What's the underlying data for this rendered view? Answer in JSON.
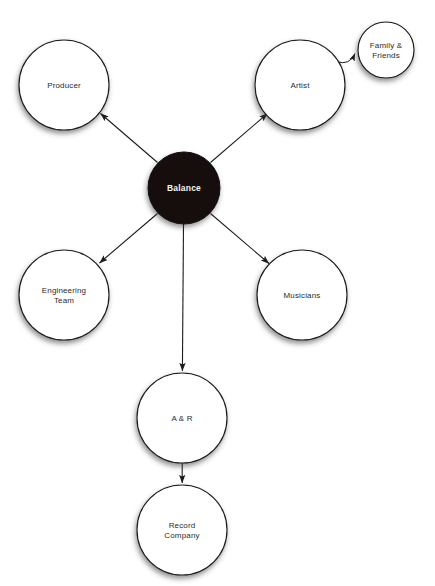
{
  "diagram": {
    "background_color": "#ffffff",
    "nodes": [
      {
        "id": "balance",
        "label": "Balance",
        "lines": [
          "Balance"
        ],
        "cx": 184,
        "cy": 188,
        "r": 36,
        "fill": "#120f0e",
        "text_color": "#f4f4f4",
        "style": "filled-dark"
      },
      {
        "id": "producer",
        "label": "Producer",
        "lines": [
          "Producer"
        ],
        "cx": 64,
        "cy": 85,
        "r": 45,
        "fill": "#ffffff",
        "text_color": "#2b2b2b",
        "style": "outlined"
      },
      {
        "id": "artist",
        "label": "Artist",
        "lines": [
          "Artist"
        ],
        "cx": 300,
        "cy": 85,
        "r": 45,
        "fill": "#ffffff",
        "text_color": "#2b2b2b",
        "style": "outlined"
      },
      {
        "id": "family-friends",
        "label": "Family & Friends",
        "lines": [
          "Family &",
          "Friends"
        ],
        "cx": 386,
        "cy": 50,
        "r": 28,
        "fill": "#ffffff",
        "text_color": "#2b2b2b",
        "style": "outlined"
      },
      {
        "id": "engineering-team",
        "label": "Engineering Team",
        "lines": [
          "Engineering",
          "Team"
        ],
        "cx": 64,
        "cy": 295,
        "r": 45,
        "fill": "#ffffff",
        "text_color": "#2b2b2b",
        "style": "outlined"
      },
      {
        "id": "musicians",
        "label": "Musicians",
        "lines": [
          "Musicians"
        ],
        "cx": 302,
        "cy": 295,
        "r": 45,
        "fill": "#ffffff",
        "text_color": "#2b2b2b",
        "style": "outlined"
      },
      {
        "id": "a-and-r",
        "label": "A & R",
        "lines": [
          "A & R"
        ],
        "cx": 182,
        "cy": 418,
        "r": 45,
        "fill": "#ffffff",
        "text_color": "#2b2b2b",
        "style": "outlined"
      },
      {
        "id": "record-company",
        "label": "Record Company",
        "lines": [
          "Record",
          "Company"
        ],
        "cx": 182,
        "cy": 530,
        "r": 45,
        "fill": "#ffffff",
        "text_color": "#2b2b2b",
        "style": "outlined"
      }
    ],
    "edges": [
      {
        "id": "balance-to-producer",
        "from": "balance",
        "to": "producer",
        "arrow": "to",
        "shape": "straight"
      },
      {
        "id": "balance-to-artist",
        "from": "balance",
        "to": "artist",
        "arrow": "to",
        "shape": "straight"
      },
      {
        "id": "balance-to-engineering-team",
        "from": "balance",
        "to": "engineering-team",
        "arrow": "to",
        "shape": "straight"
      },
      {
        "id": "balance-to-musicians",
        "from": "balance",
        "to": "musicians",
        "arrow": "to",
        "shape": "straight"
      },
      {
        "id": "balance-to-a-and-r",
        "from": "balance",
        "to": "a-and-r",
        "arrow": "to",
        "shape": "straight"
      },
      {
        "id": "artist-to-family-friends",
        "from": "artist",
        "to": "family-friends",
        "arrow": "to",
        "shape": "curved"
      },
      {
        "id": "a-and-r-to-record-company",
        "from": "a-and-r",
        "to": "record-company",
        "arrow": "to",
        "shape": "straight"
      }
    ],
    "colors": {
      "node_stroke": "#1a1a1a",
      "node_fill": "#ffffff",
      "center_fill": "#120f0e",
      "center_text": "#f4f4f4",
      "label_text": "#2b2b2b",
      "edge_stroke": "#1c1c1c"
    }
  }
}
